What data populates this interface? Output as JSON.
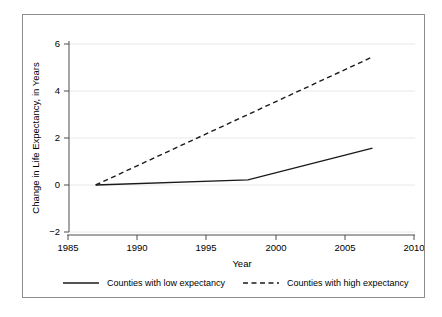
{
  "chart_data": {
    "type": "line",
    "title": "",
    "xlabel": "Year",
    "ylabel": "Change in Life Expectancy, in Years",
    "xlim": [
      1985,
      2010
    ],
    "ylim": [
      -2,
      6
    ],
    "xticks": [
      1985,
      1990,
      1995,
      2000,
      2005,
      2010
    ],
    "xtick_labels": [
      "1985",
      "1990",
      "1995",
      "2000",
      "2005",
      "2010"
    ],
    "yticks": [
      -2,
      0,
      2,
      4,
      6
    ],
    "ytick_labels": [
      "−2",
      "0",
      "2",
      "4",
      "6"
    ],
    "grid": "horizontal",
    "legend_position": "bottom",
    "series": [
      {
        "name": "Counties with low expectancy",
        "style": "solid",
        "color": "#1a1a1a",
        "x": [
          1987,
          1998,
          2007
        ],
        "values": [
          0,
          0.22,
          1.57
        ]
      },
      {
        "name": "Counties with high expectancy",
        "style": "dashed",
        "color": "#1a1a1a",
        "x": [
          1987,
          2007
        ],
        "values": [
          0,
          5.45
        ]
      }
    ]
  },
  "legend": {
    "items": [
      {
        "label": "Counties with low expectancy",
        "style": "solid"
      },
      {
        "label": "Counties with high expectancy",
        "style": "dashed"
      }
    ]
  },
  "colors": {
    "frame_border": "#8c8c8c",
    "grid": "#e6e6e6",
    "axis": "#4d4d4d",
    "line": "#1a1a1a",
    "background": "#ffffff"
  }
}
